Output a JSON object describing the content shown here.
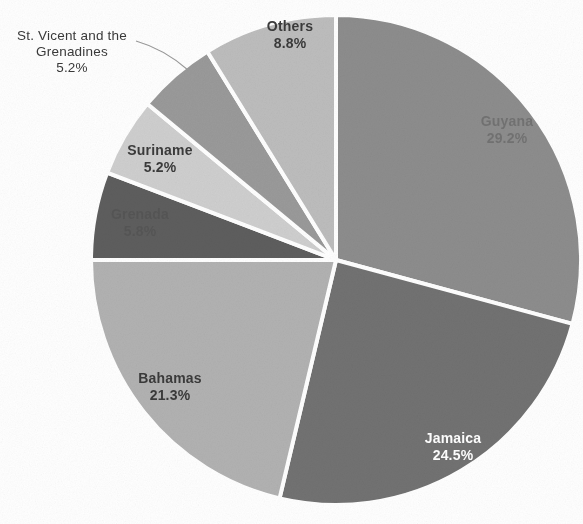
{
  "chart_data": {
    "type": "pie",
    "title": "",
    "subtitle": "",
    "xlabel": "",
    "ylabel": "",
    "legend_position": "none",
    "grid": false,
    "labels_show_percent": true,
    "categories": [
      "Guyana",
      "Jamaica",
      "Bahamas",
      "Grenada",
      "Suriname",
      "St. Vicent and the Grenadines",
      "Others"
    ],
    "values": [
      29.2,
      24.5,
      21.3,
      5.8,
      5.2,
      5.2,
      8.8
    ],
    "slices": [
      {
        "name": "Guyana",
        "label": "Guyana",
        "percent": "29.2%",
        "value": 29.2,
        "color": "#8d8d8d",
        "label_placement": "inside",
        "label_color": "#5d5d5d"
      },
      {
        "name": "Jamaica",
        "label": "Jamaica",
        "percent": "24.5%",
        "value": 24.5,
        "color": "#727272",
        "label_placement": "inside",
        "label_color": "#ffffff"
      },
      {
        "name": "Bahamas",
        "label": "Bahamas",
        "percent": "21.3%",
        "value": 21.3,
        "color": "#b2b2b2",
        "label_placement": "inside",
        "label_color": "#3b3b3b"
      },
      {
        "name": "Grenada",
        "label": "Grenada",
        "percent": "5.8%",
        "value": 5.8,
        "color": "#5e5e5e",
        "label_placement": "inside",
        "label_color": "#4a4a4a"
      },
      {
        "name": "Suriname",
        "label": "Suriname",
        "percent": "5.2%",
        "value": 5.2,
        "color": "#cfcfcf",
        "label_placement": "inside",
        "label_color": "#3b3b3b"
      },
      {
        "name": "St. Vicent and the Grenadines",
        "label_line1": "St. Vicent and the",
        "label_line2": "Grenadines",
        "percent": "5.2%",
        "value": 5.2,
        "color": "#9a9a9a",
        "label_placement": "outside-leader",
        "label_color": "#3a3a3a"
      },
      {
        "name": "Others",
        "label": "Others",
        "percent": "8.8%",
        "value": 8.8,
        "color": "#bdbdbd",
        "label_placement": "inside",
        "label_color": "#3b3b3b"
      }
    ],
    "geometry": {
      "center_x": 336,
      "center_y": 260,
      "radius": 245,
      "start_angle_deg": -90,
      "direction": "clockwise",
      "separator_color": "#ffffff",
      "separator_width": 4
    },
    "background_color": "#ffffff"
  }
}
